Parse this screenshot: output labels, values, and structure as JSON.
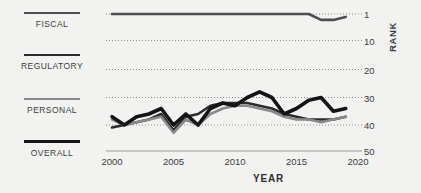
{
  "background_color": "#f2f2f0",
  "legend": {
    "items": [
      {
        "label": "FISCAL",
        "color": "#4d4d4d",
        "width": 2.6
      },
      {
        "label": "REGULATORY",
        "color": "#2b2b2b",
        "width": 2.6
      },
      {
        "label": "PERSONAL",
        "color": "#8a8a8a",
        "width": 2.6
      },
      {
        "label": "OVERALL",
        "color": "#141414",
        "width": 3.6
      }
    ]
  },
  "axes": {
    "ylabel": "RANK",
    "xlabel": "YEAR",
    "y_ticks": [
      1,
      10,
      20,
      30,
      40,
      50
    ],
    "x_ticks": [
      2000,
      2005,
      2010,
      2015,
      2020
    ]
  },
  "chart_data": {
    "type": "line",
    "title": "",
    "xlabel": "YEAR",
    "ylabel": "RANK",
    "xlim": [
      2000,
      2020
    ],
    "ylim": [
      1,
      50
    ],
    "y_inverted": true,
    "grid": true,
    "grid_style": "dotted",
    "legend_position": "left",
    "y_ticks": [
      1,
      10,
      20,
      30,
      40,
      50
    ],
    "x_ticks": [
      2000,
      2005,
      2010,
      2015,
      2020
    ],
    "x": [
      2000,
      2001,
      2002,
      2003,
      2004,
      2005,
      2006,
      2007,
      2008,
      2009,
      2010,
      2011,
      2012,
      2013,
      2014,
      2015,
      2016,
      2017,
      2018,
      2019
    ],
    "series": [
      {
        "name": "FISCAL",
        "color": "#4d4d4d",
        "width": 2.6,
        "values": [
          1,
          1,
          1,
          1,
          1,
          1,
          1,
          1,
          1,
          1,
          1,
          1,
          1,
          1,
          1,
          1,
          1,
          3,
          3,
          2
        ]
      },
      {
        "name": "REGULATORY",
        "color": "#2b2b2b",
        "width": 2.6,
        "values": [
          41,
          40,
          39,
          38,
          36,
          42,
          37,
          36,
          33,
          32,
          32,
          32,
          33,
          34,
          36,
          37,
          38,
          38,
          38,
          37
        ]
      },
      {
        "name": "PERSONAL",
        "color": "#8a8a8a",
        "width": 2.6,
        "values": [
          38,
          40,
          39,
          38,
          37,
          43,
          38,
          40,
          36,
          34,
          33,
          33,
          34,
          35,
          37,
          38,
          38,
          39,
          38,
          37
        ]
      },
      {
        "name": "OVERALL",
        "color": "#141414",
        "width": 3.6,
        "values": [
          37,
          40,
          37,
          36,
          34,
          40,
          36,
          40,
          34,
          32,
          33,
          30,
          28,
          30,
          36,
          34,
          31,
          30,
          35,
          34
        ]
      }
    ]
  }
}
